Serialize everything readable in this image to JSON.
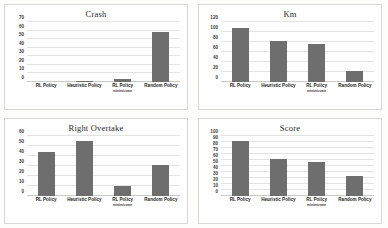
{
  "figure": {
    "background_color": "#fdfdfc",
    "bar_color": "#6e6e6e",
    "gridline_color": "#e3e3e1",
    "panel_border_color": "#d8d8d6"
  },
  "categories": [
    {
      "label": "RL Policy",
      "sub": ""
    },
    {
      "label": "Heuristic Policy",
      "sub": ""
    },
    {
      "label": "RL Policy",
      "sub": "minimizzate"
    },
    {
      "label": "Random Policy",
      "sub": ""
    }
  ],
  "chart_data": [
    {
      "type": "bar",
      "title": "Crash",
      "categories": [
        "RL Policy",
        "Heuristic Policy",
        "RL Policy minimizzate",
        "Random Policy"
      ],
      "values": [
        0,
        0.7,
        4,
        58
      ],
      "xlabel": "",
      "ylabel": "",
      "ylim": [
        0,
        70
      ],
      "yticks": [
        0,
        10,
        20,
        30,
        40,
        50,
        60,
        70
      ],
      "grid": true,
      "legend": "none"
    },
    {
      "type": "bar",
      "title": "Km",
      "categories": [
        "RL Policy",
        "Heuristic Policy",
        "RL Policy minimizzate",
        "Random Policy"
      ],
      "values": [
        108,
        83,
        77,
        22
      ],
      "xlabel": "",
      "ylabel": "",
      "ylim": [
        0,
        120
      ],
      "yticks": [
        0,
        20,
        40,
        60,
        80,
        100,
        120
      ],
      "grid": true,
      "legend": "none"
    },
    {
      "type": "bar",
      "title": "Right Overtake",
      "categories": [
        "RL Policy",
        "Heuristic Policy",
        "RL Policy minimizzate",
        "Random Policy"
      ],
      "values": [
        44,
        55,
        10.5,
        31
      ],
      "xlabel": "",
      "ylabel": "",
      "ylim": [
        0,
        60
      ],
      "yticks": [
        0,
        10,
        20,
        30,
        40,
        50,
        60
      ],
      "grid": true,
      "legend": "none"
    },
    {
      "type": "bar",
      "title": "Score",
      "categories": [
        "RL Policy",
        "Heuristic Policy",
        "RL Policy minimizzate",
        "Random Policy"
      ],
      "values": [
        91,
        61,
        57,
        33
      ],
      "xlabel": "",
      "ylabel": "",
      "ylim": [
        0,
        100
      ],
      "yticks": [
        0,
        10,
        20,
        30,
        40,
        50,
        60,
        70,
        80,
        90,
        100
      ],
      "grid": true,
      "legend": "none"
    }
  ]
}
